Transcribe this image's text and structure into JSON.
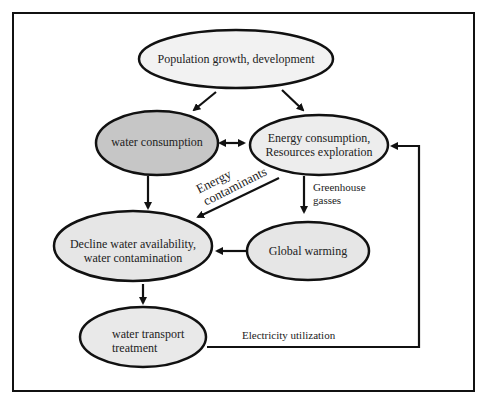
{
  "diagram": {
    "nodes": [
      {
        "id": "population",
        "label": "Population growth, development",
        "fill": "#f2f2f2"
      },
      {
        "id": "water_consumption",
        "label": "water consumption",
        "fill": "#c6c6c6"
      },
      {
        "id": "energy",
        "line1": "Energy consumption,",
        "line2": "Resources exploration",
        "fill": "#ededed"
      },
      {
        "id": "decline",
        "line1": "Decline water availability,",
        "line2": "water contamination",
        "fill": "#e6e6e6"
      },
      {
        "id": "global_warming",
        "label": "Global warming",
        "fill": "#e6e6e6"
      },
      {
        "id": "water_transport",
        "line1": "water transport",
        "line2": "treatment",
        "fill": "#e9e9e9"
      }
    ],
    "edge_labels": {
      "energy_contaminants_1": "Energy",
      "energy_contaminants_2": "contaminants",
      "greenhouse_1": "Greenhouse",
      "greenhouse_2": "gasses",
      "electricity": "Electricity utilization"
    },
    "edges": [
      {
        "from": "population",
        "to": "water_consumption"
      },
      {
        "from": "population",
        "to": "energy"
      },
      {
        "from": "water_consumption",
        "to": "energy",
        "bidirectional": true
      },
      {
        "from": "water_consumption",
        "to": "decline"
      },
      {
        "from": "energy",
        "to": "decline",
        "label": "Energy contaminants"
      },
      {
        "from": "energy",
        "to": "global_warming",
        "label": "Greenhouse gasses"
      },
      {
        "from": "global_warming",
        "to": "decline"
      },
      {
        "from": "decline",
        "to": "water_transport"
      },
      {
        "from": "water_transport",
        "to": "energy",
        "label": "Electricity utilization"
      }
    ]
  }
}
